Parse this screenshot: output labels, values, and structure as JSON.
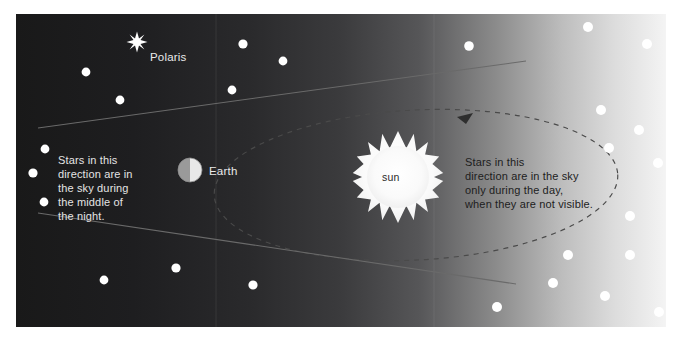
{
  "figure": {
    "panel": {
      "x": 16,
      "y": 14,
      "width": 650,
      "height": 313
    },
    "colors": {
      "page_background": "#ffffff",
      "night_sky_dark": "#1f1f21",
      "day_sky_light": "#f2f2f2",
      "star_white": "#ffffff",
      "light_text": "#e9e9e9",
      "dark_text": "#1d1d1d",
      "sight_line": "#555555",
      "orbit_dash": "#3c3c3c",
      "sun_body": "#fbfbfb"
    },
    "background": {
      "type": "horizontal-gradient",
      "from": "#1c1c1e",
      "to": "#f4f4f4",
      "description": "dark night sky on the left fading to bright daylight on the right"
    }
  },
  "labels": {
    "polaris": "Polaris",
    "earth": "Earth",
    "sun": "sun",
    "night_note": "Stars in this\ndirection are in\nthe sky during\nthe middle of\nthe night.",
    "day_note": "Stars in this\ndirection are in the sky\nonly during the day,\nwhen they are not visible."
  },
  "bodies": {
    "polaris": {
      "cx": 137,
      "cy": 42,
      "rays": 10,
      "outer_r": 10,
      "inner_r": 3.6
    },
    "earth": {
      "cx": 190,
      "cy": 170,
      "r": 12,
      "lit_side": "left"
    },
    "sun": {
      "cx": 398,
      "cy": 177,
      "rays": 18,
      "body_r": 30,
      "ray_r": 46
    }
  },
  "orbit": {
    "type": "dashed-ellipse",
    "cx": 400,
    "cy": 171,
    "rx": 202,
    "ry": 75,
    "rotation_deg": -3,
    "dash": "5 5",
    "arrow": {
      "x": 448,
      "y": 104,
      "direction": "counterclockwise"
    }
  },
  "sight_lines": [
    {
      "name": "upper-sight-line",
      "x1": 38,
      "y1": 128,
      "x2": 526,
      "y2": 61
    },
    {
      "name": "lower-sight-line",
      "x1": 38,
      "y1": 213,
      "x2": 516,
      "y2": 284
    }
  ],
  "stars": {
    "night_side": [
      {
        "cx": 86,
        "cy": 72,
        "r": 4.4
      },
      {
        "cx": 120,
        "cy": 100,
        "r": 4.4
      },
      {
        "cx": 243,
        "cy": 44,
        "r": 4.6
      },
      {
        "cx": 283,
        "cy": 61,
        "r": 4.4
      },
      {
        "cx": 232,
        "cy": 90,
        "r": 4.4
      },
      {
        "cx": 45,
        "cy": 149,
        "r": 4.4
      },
      {
        "cx": 33,
        "cy": 173,
        "r": 4.6
      },
      {
        "cx": 44,
        "cy": 202,
        "r": 4.4
      },
      {
        "cx": 176,
        "cy": 268,
        "r": 4.6
      },
      {
        "cx": 104,
        "cy": 280,
        "r": 4.4
      },
      {
        "cx": 253,
        "cy": 285,
        "r": 4.6
      }
    ],
    "day_side": [
      {
        "cx": 469,
        "cy": 46,
        "r": 4.8
      },
      {
        "cx": 588,
        "cy": 27,
        "r": 5.0
      },
      {
        "cx": 647,
        "cy": 44,
        "r": 5.0
      },
      {
        "cx": 601,
        "cy": 110,
        "r": 5.0
      },
      {
        "cx": 639,
        "cy": 130,
        "r": 5.0
      },
      {
        "cx": 609,
        "cy": 148,
        "r": 5.0
      },
      {
        "cx": 658,
        "cy": 163,
        "r": 5.0
      },
      {
        "cx": 630,
        "cy": 216,
        "r": 5.0
      },
      {
        "cx": 568,
        "cy": 255,
        "r": 5.0
      },
      {
        "cx": 630,
        "cy": 255,
        "r": 5.0
      },
      {
        "cx": 553,
        "cy": 283,
        "r": 5.0
      },
      {
        "cx": 605,
        "cy": 296,
        "r": 5.0
      },
      {
        "cx": 659,
        "cy": 312,
        "r": 5.0
      },
      {
        "cx": 497,
        "cy": 307,
        "r": 5.0
      }
    ]
  }
}
